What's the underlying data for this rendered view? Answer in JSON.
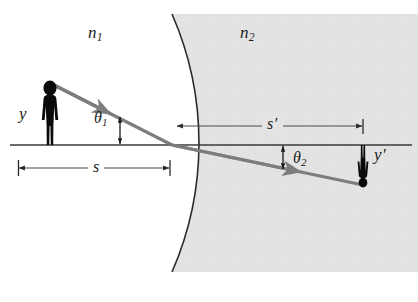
{
  "figure": {
    "background_color": "#ffffff",
    "medium_shade_color": "#e3e3e3",
    "line_color": "#2b2b2b",
    "ray_color": "#7d7d7d",
    "object_color": "#0a0a0a"
  },
  "labels": {
    "n1": {
      "base": "n",
      "sub": "1"
    },
    "n2": {
      "base": "n",
      "sub": "2"
    },
    "theta1": {
      "base": "θ",
      "sub": "1"
    },
    "theta2": {
      "base": "θ",
      "sub": "2"
    },
    "object_height": "y",
    "image_height": "y′",
    "object_distance": "s",
    "image_distance": "s′"
  },
  "geometry": {
    "axis": {
      "x1": 10,
      "y": 145,
      "x2": 412
    },
    "vertex": {
      "x": 172,
      "y": 145
    },
    "object": {
      "x": 50,
      "y_base": 145,
      "height": 62
    },
    "image": {
      "x": 363,
      "y_base": 145,
      "height": 40
    },
    "surface": {
      "center_x": -150,
      "radius": 322,
      "top_y": 14,
      "bottom_y": 272
    },
    "incident_ray": {
      "from_x": 50,
      "from_y": 83,
      "to_x": 172,
      "to_y": 145
    },
    "refracted_ray": {
      "from_x": 172,
      "from_y": 145,
      "to_x": 363,
      "to_y": 185
    },
    "dim_s": {
      "x1": 18,
      "x2": 170,
      "y": 168
    },
    "dim_s_prime": {
      "x1": 176,
      "x2": 363,
      "y": 126
    }
  },
  "annotations": {
    "medium_left_label_pos": {
      "x": 88,
      "y": 32
    },
    "medium_right_label_pos": {
      "x": 240,
      "y": 32
    },
    "theta1_pos": {
      "x": 92,
      "y": 113
    },
    "theta2_pos": {
      "x": 291,
      "y": 155
    },
    "y_pos": {
      "x": 18,
      "y": 106
    },
    "y_prime_pos": {
      "x": 372,
      "y": 150
    },
    "s_pos": {
      "x": 88,
      "y": 159
    },
    "s_prime_pos": {
      "x": 263,
      "y": 116
    }
  }
}
